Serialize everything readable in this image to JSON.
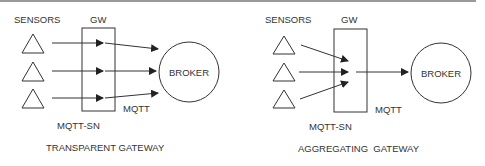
{
  "diagrams": [
    {
      "name": "transparent",
      "sensors_label": "SENSORS",
      "gateway_label": "GW",
      "broker_label": "BROKER",
      "mqtt_label": "MQTT",
      "mqttsn_label": "MQTT-SN",
      "caption": "TRANSPARENT GATEWAY"
    },
    {
      "name": "aggregating",
      "sensors_label": "SENSORS",
      "gateway_label": "GW",
      "broker_label": "BROKER",
      "mqtt_label": "MQTT",
      "mqttsn_label": "MQTT-SN",
      "caption": "AGGREGATING  GATEWAY"
    }
  ],
  "colors": {
    "stroke": "#333333",
    "text": "#333333",
    "topline": "#9a9a9a"
  }
}
